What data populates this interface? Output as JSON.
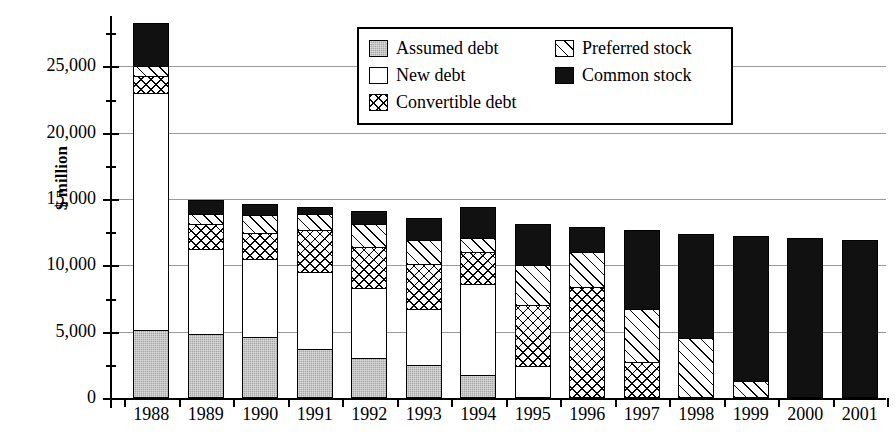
{
  "chart_data": {
    "type": "bar",
    "subtype": "stacked-vertical",
    "title": "",
    "xlabel": "",
    "ylabel": "$ million",
    "ylim": [
      0,
      28500
    ],
    "yticks": [
      0,
      5000,
      10000,
      15000,
      20000,
      25000
    ],
    "ytick_labels": [
      "0",
      "5,000",
      "10,000",
      "15,000",
      "20,000",
      "25,000"
    ],
    "grid": "horizontal",
    "legend_position": "top-center",
    "categories": [
      "1988",
      "1989",
      "1990",
      "1991",
      "1992",
      "1993",
      "1994",
      "1995",
      "1996",
      "1997",
      "1998",
      "1999",
      "2000",
      "2001"
    ],
    "series": [
      {
        "name": "Assumed debt",
        "pattern": "solid-gray",
        "color": "#a8a8a8",
        "values": [
          5100,
          4850,
          4600,
          3700,
          3000,
          2500,
          1700,
          0,
          0,
          0,
          0,
          0,
          0,
          0
        ]
      },
      {
        "name": "New debt",
        "pattern": "white",
        "color": "#ffffff",
        "values": [
          17900,
          6350,
          5900,
          5800,
          5300,
          4200,
          6900,
          2400,
          0,
          0,
          0,
          0,
          0,
          0
        ]
      },
      {
        "name": "Convertible debt",
        "pattern": "cross-hatch",
        "color": "#ffffff",
        "values": [
          1250,
          1900,
          1950,
          3200,
          3100,
          3400,
          2400,
          4600,
          8400,
          2700,
          0,
          0,
          0,
          0
        ]
      },
      {
        "name": "Preferred stock",
        "pattern": "diagonal-hatch",
        "color": "#ffffff",
        "values": [
          800,
          800,
          1350,
          1200,
          1700,
          1800,
          1100,
          3000,
          2600,
          4000,
          4500,
          1300,
          0,
          0
        ]
      },
      {
        "name": "Common stock",
        "pattern": "solid-black",
        "color": "#111111",
        "values": [
          3250,
          1000,
          800,
          500,
          1000,
          1700,
          2300,
          3100,
          1900,
          6000,
          7900,
          10900,
          12050,
          11900
        ]
      }
    ],
    "totals": [
      28300,
      14900,
      14600,
      14400,
      14100,
      13600,
      13400,
      13100,
      12900,
      12700,
      12400,
      12200,
      12050,
      11900
    ]
  },
  "legend": {
    "items": [
      {
        "label": "Assumed debt",
        "pattern": "solid-gray"
      },
      {
        "label": "Preferred stock",
        "pattern": "diagonal-hatch"
      },
      {
        "label": "New debt",
        "pattern": "white"
      },
      {
        "label": "Common stock",
        "pattern": "solid-black"
      },
      {
        "label": "Convertible debt",
        "pattern": "cross-hatch"
      }
    ]
  }
}
